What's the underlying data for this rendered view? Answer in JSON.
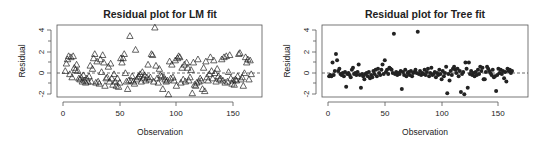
{
  "chart_data": [
    {
      "type": "scatter",
      "title": "Residual plot for LM fit",
      "xlabel": "Observation",
      "ylabel": "Residual",
      "xlim": [
        0,
        168
      ],
      "ylim": [
        -2.2,
        4.3
      ],
      "xticks": [
        0,
        50,
        100,
        150
      ],
      "yticks": [
        -2,
        0,
        2,
        4
      ],
      "marker": "open-triangle",
      "reference_line": {
        "y": 0,
        "style": "dashed"
      },
      "grid": false,
      "points": [
        [
          2,
          0.2
        ],
        [
          3,
          0.9
        ],
        [
          4,
          1.3
        ],
        [
          5,
          1.6
        ],
        [
          6,
          -0.1
        ],
        [
          7,
          1.5
        ],
        [
          8,
          -0.4
        ],
        [
          9,
          1.6
        ],
        [
          10,
          0.5
        ],
        [
          11,
          0.3
        ],
        [
          12,
          0.8
        ],
        [
          13,
          0.2
        ],
        [
          14,
          -0.5
        ],
        [
          15,
          -0.6
        ],
        [
          16,
          -0.4
        ],
        [
          17,
          -0.8
        ],
        [
          18,
          -0.2
        ],
        [
          19,
          -0.7
        ],
        [
          20,
          -0.9
        ],
        [
          21,
          -0.5
        ],
        [
          22,
          -0.8
        ],
        [
          23,
          -0.3
        ],
        [
          24,
          0.7
        ],
        [
          25,
          -0.8
        ],
        [
          26,
          0.4
        ],
        [
          27,
          1.4
        ],
        [
          28,
          1.8
        ],
        [
          29,
          -0.9
        ],
        [
          30,
          1.1
        ],
        [
          31,
          -0.8
        ],
        [
          32,
          -1.0
        ],
        [
          33,
          1.3
        ],
        [
          34,
          0.1
        ],
        [
          35,
          1.7
        ],
        [
          36,
          1.0
        ],
        [
          37,
          -1.2
        ],
        [
          38,
          -0.5
        ],
        [
          39,
          -0.4
        ],
        [
          40,
          0.6
        ],
        [
          41,
          -0.8
        ],
        [
          42,
          0.9
        ],
        [
          43,
          -0.5
        ],
        [
          44,
          -1.1
        ],
        [
          45,
          -0.1
        ],
        [
          46,
          -0.8
        ],
        [
          47,
          -1.2
        ],
        [
          48,
          -0.5
        ],
        [
          49,
          -1.3
        ],
        [
          50,
          -0.9
        ],
        [
          51,
          1.4
        ],
        [
          52,
          1.0
        ],
        [
          53,
          1.4
        ],
        [
          54,
          1.8
        ],
        [
          55,
          0.0
        ],
        [
          56,
          -0.8
        ],
        [
          57,
          -1.5
        ],
        [
          58,
          -0.7
        ],
        [
          59,
          3.5
        ],
        [
          60,
          -0.7
        ],
        [
          61,
          -0.3
        ],
        [
          62,
          -0.8
        ],
        [
          63,
          -1.0
        ],
        [
          64,
          2.2
        ],
        [
          65,
          -0.6
        ],
        [
          66,
          -0.4
        ],
        [
          67,
          -0.3
        ],
        [
          68,
          -0.1
        ],
        [
          69,
          -0.8
        ],
        [
          70,
          0.1
        ],
        [
          71,
          -0.5
        ],
        [
          72,
          -0.2
        ],
        [
          73,
          -0.7
        ],
        [
          74,
          -0.4
        ],
        [
          75,
          0.8
        ],
        [
          76,
          -0.6
        ],
        [
          77,
          -0.4
        ],
        [
          78,
          1.8
        ],
        [
          79,
          1.7
        ],
        [
          80,
          -0.8
        ],
        [
          81,
          4.3
        ],
        [
          82,
          0.7
        ],
        [
          83,
          -0.5
        ],
        [
          84,
          -0.9
        ],
        [
          85,
          0.4
        ],
        [
          86,
          -0.2
        ],
        [
          87,
          -0.3
        ],
        [
          88,
          -1.5
        ],
        [
          89,
          -0.4
        ],
        [
          90,
          -0.6
        ],
        [
          91,
          -0.8
        ],
        [
          92,
          -0.7
        ],
        [
          93,
          -2.0
        ],
        [
          94,
          1.1
        ],
        [
          95,
          -0.5
        ],
        [
          96,
          0.8
        ],
        [
          97,
          -0.4
        ],
        [
          98,
          -0.7
        ],
        [
          99,
          1.2
        ],
        [
          100,
          -1.2
        ],
        [
          101,
          1.4
        ],
        [
          102,
          1.6
        ],
        [
          103,
          1.5
        ],
        [
          104,
          -0.9
        ],
        [
          105,
          0.5
        ],
        [
          106,
          -0.6
        ],
        [
          107,
          0.8
        ],
        [
          108,
          -0.8
        ],
        [
          109,
          1.0
        ],
        [
          110,
          0.5
        ],
        [
          111,
          -0.7
        ],
        [
          112,
          -0.4
        ],
        [
          113,
          0.3
        ],
        [
          114,
          -1.9
        ],
        [
          115,
          1.0
        ],
        [
          116,
          -1.1
        ],
        [
          117,
          -1.2
        ],
        [
          118,
          -0.9
        ],
        [
          119,
          1.3
        ],
        [
          120,
          -0.8
        ],
        [
          121,
          -0.5
        ],
        [
          122,
          -0.7
        ],
        [
          123,
          -1.5
        ],
        [
          124,
          0.5
        ],
        [
          125,
          -1.7
        ],
        [
          126,
          1.1
        ],
        [
          127,
          -0.4
        ],
        [
          128,
          -0.7
        ],
        [
          129,
          -0.1
        ],
        [
          130,
          1.5
        ],
        [
          131,
          0.2
        ],
        [
          132,
          -0.5
        ],
        [
          133,
          1.2
        ],
        [
          134,
          0.0
        ],
        [
          135,
          -0.8
        ],
        [
          136,
          0.4
        ],
        [
          137,
          -0.3
        ],
        [
          138,
          -0.6
        ],
        [
          139,
          -0.5
        ],
        [
          140,
          1.3
        ],
        [
          141,
          -0.7
        ],
        [
          142,
          1.5
        ],
        [
          143,
          -0.9
        ],
        [
          144,
          1.6
        ],
        [
          145,
          -0.8
        ],
        [
          146,
          0.1
        ],
        [
          147,
          1.7
        ],
        [
          148,
          -0.5
        ],
        [
          149,
          -1.0
        ],
        [
          150,
          -0.7
        ],
        [
          151,
          -1.1
        ],
        [
          152,
          -0.6
        ],
        [
          153,
          -0.7
        ],
        [
          154,
          -0.3
        ],
        [
          155,
          1.8
        ],
        [
          156,
          1.9
        ],
        [
          157,
          -0.6
        ],
        [
          158,
          -0.4
        ],
        [
          159,
          -1.2
        ],
        [
          160,
          0.0
        ],
        [
          161,
          1.5
        ],
        [
          162,
          1.0
        ],
        [
          163,
          1.3
        ],
        [
          164,
          -0.6
        ],
        [
          165,
          1.2
        ],
        [
          166,
          -0.1
        ]
      ]
    },
    {
      "type": "scatter",
      "title": "Residual plot for Tree fit",
      "xlabel": "Observation",
      "ylabel": "Residual",
      "xlim": [
        0,
        168
      ],
      "ylim": [
        -2.2,
        4.3
      ],
      "xticks": [
        0,
        50,
        100,
        150
      ],
      "yticks": [
        -2,
        0,
        2,
        4
      ],
      "marker": "filled-circle",
      "reference_line": {
        "y": 0,
        "style": "dashed"
      },
      "grid": false,
      "points": [
        [
          1,
          -0.3
        ],
        [
          2,
          -0.2
        ],
        [
          3,
          -0.3
        ],
        [
          4,
          1.0
        ],
        [
          5,
          -0.2
        ],
        [
          6,
          0.2
        ],
        [
          7,
          1.8
        ],
        [
          8,
          1.2
        ],
        [
          9,
          0.2
        ],
        [
          10,
          0.4
        ],
        [
          11,
          -0.1
        ],
        [
          12,
          -0.2
        ],
        [
          13,
          0.0
        ],
        [
          14,
          -0.3
        ],
        [
          15,
          0.1
        ],
        [
          16,
          -1.3
        ],
        [
          17,
          -0.1
        ],
        [
          18,
          0.0
        ],
        [
          19,
          -0.2
        ],
        [
          20,
          -0.4
        ],
        [
          21,
          0.3
        ],
        [
          22,
          0.5
        ],
        [
          23,
          -0.1
        ],
        [
          24,
          0.0
        ],
        [
          25,
          -0.2
        ],
        [
          26,
          0.1
        ],
        [
          27,
          0.8
        ],
        [
          28,
          -0.2
        ],
        [
          29,
          -1.4
        ],
        [
          30,
          -0.1
        ],
        [
          31,
          -0.3
        ],
        [
          32,
          -0.6
        ],
        [
          33,
          -0.1
        ],
        [
          34,
          0.0
        ],
        [
          35,
          -0.3
        ],
        [
          36,
          0.1
        ],
        [
          37,
          -0.5
        ],
        [
          38,
          -0.2
        ],
        [
          39,
          -0.4
        ],
        [
          40,
          0.2
        ],
        [
          41,
          -0.1
        ],
        [
          42,
          0.3
        ],
        [
          43,
          -0.3
        ],
        [
          44,
          0.4
        ],
        [
          45,
          0.0
        ],
        [
          46,
          -0.2
        ],
        [
          47,
          0.3
        ],
        [
          48,
          0.8
        ],
        [
          49,
          -0.1
        ],
        [
          50,
          1.2
        ],
        [
          51,
          0.1
        ],
        [
          52,
          0.3
        ],
        [
          53,
          -0.1
        ],
        [
          54,
          0.5
        ],
        [
          55,
          0.4
        ],
        [
          56,
          0.3
        ],
        [
          57,
          0.0
        ],
        [
          58,
          3.7
        ],
        [
          59,
          -0.1
        ],
        [
          60,
          0.1
        ],
        [
          61,
          -0.2
        ],
        [
          62,
          0.0
        ],
        [
          63,
          -0.1
        ],
        [
          64,
          0.2
        ],
        [
          65,
          -1.5
        ],
        [
          66,
          0.1
        ],
        [
          67,
          -0.2
        ],
        [
          68,
          0.3
        ],
        [
          69,
          -0.3
        ],
        [
          70,
          0.0
        ],
        [
          71,
          0.1
        ],
        [
          72,
          -0.2
        ],
        [
          73,
          0.2
        ],
        [
          74,
          -0.3
        ],
        [
          75,
          0.0
        ],
        [
          76,
          0.1
        ],
        [
          77,
          0.3
        ],
        [
          78,
          0.0
        ],
        [
          79,
          3.9
        ],
        [
          80,
          -0.1
        ],
        [
          81,
          0.2
        ],
        [
          82,
          -0.2
        ],
        [
          83,
          0.0
        ],
        [
          84,
          -0.1
        ],
        [
          85,
          0.3
        ],
        [
          86,
          -0.2
        ],
        [
          87,
          0.1
        ],
        [
          88,
          0.4
        ],
        [
          89,
          -0.3
        ],
        [
          90,
          0.0
        ],
        [
          91,
          0.5
        ],
        [
          92,
          -0.2
        ],
        [
          93,
          -0.1
        ],
        [
          94,
          0.1
        ],
        [
          95,
          -0.4
        ],
        [
          96,
          0.0
        ],
        [
          97,
          -0.2
        ],
        [
          98,
          0.3
        ],
        [
          99,
          -0.1
        ],
        [
          100,
          -0.6
        ],
        [
          101,
          0.2
        ],
        [
          102,
          -0.3
        ],
        [
          103,
          0.0
        ],
        [
          104,
          0.6
        ],
        [
          105,
          -1.9
        ],
        [
          106,
          -0.1
        ],
        [
          107,
          -0.7
        ],
        [
          108,
          0.2
        ],
        [
          109,
          -0.2
        ],
        [
          110,
          0.4
        ],
        [
          111,
          0.6
        ],
        [
          112,
          0.3
        ],
        [
          113,
          0.0
        ],
        [
          114,
          0.4
        ],
        [
          115,
          -0.3
        ],
        [
          116,
          0.2
        ],
        [
          117,
          -1.8
        ],
        [
          118,
          -0.1
        ],
        [
          119,
          0.1
        ],
        [
          120,
          -2.0
        ],
        [
          121,
          1.0
        ],
        [
          122,
          0.4
        ],
        [
          123,
          -1.4
        ],
        [
          124,
          1.0
        ],
        [
          125,
          -0.1
        ],
        [
          126,
          0.2
        ],
        [
          127,
          -0.2
        ],
        [
          128,
          0.0
        ],
        [
          129,
          -0.3
        ],
        [
          130,
          0.1
        ],
        [
          131,
          -0.2
        ],
        [
          132,
          0.3
        ],
        [
          133,
          -0.1
        ],
        [
          134,
          0.6
        ],
        [
          135,
          0.2
        ],
        [
          136,
          0.5
        ],
        [
          137,
          -0.6
        ],
        [
          138,
          -0.6
        ],
        [
          139,
          0.1
        ],
        [
          140,
          0.6
        ],
        [
          141,
          0.4
        ],
        [
          142,
          0.2
        ],
        [
          143,
          0.0
        ],
        [
          144,
          -0.2
        ],
        [
          145,
          0.3
        ],
        [
          146,
          -0.4
        ],
        [
          147,
          -0.3
        ],
        [
          148,
          -1.7
        ],
        [
          149,
          -0.2
        ],
        [
          150,
          0.4
        ],
        [
          151,
          0.0
        ],
        [
          152,
          0.3
        ],
        [
          153,
          -0.1
        ],
        [
          154,
          0.2
        ],
        [
          155,
          -0.5
        ],
        [
          156,
          0.1
        ],
        [
          157,
          -0.8
        ],
        [
          158,
          0.4
        ],
        [
          159,
          0.2
        ],
        [
          160,
          0.3
        ],
        [
          161,
          0.0
        ],
        [
          162,
          0.2
        ]
      ]
    }
  ],
  "plots": {
    "left": {
      "title": "Residual plot for LM fit",
      "xlabel": "Observation",
      "ylabel": "Residual",
      "xtick_labels": [
        "0",
        "50",
        "100",
        "150"
      ],
      "ytick_labels": [
        "-2",
        "0",
        "2",
        "4"
      ]
    },
    "right": {
      "title": "Residual plot for Tree fit",
      "xlabel": "Observation",
      "ylabel": "Residual",
      "xtick_labels": [
        "0",
        "50",
        "100",
        "150"
      ],
      "ytick_labels": [
        "-2",
        "0",
        "2",
        "4"
      ]
    }
  },
  "colors": {
    "marker": "#222222",
    "axis": "#555555",
    "background": "#ffffff"
  }
}
